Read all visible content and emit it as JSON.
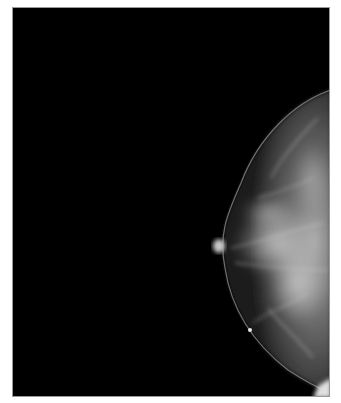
{
  "image": {
    "type": "mammogram",
    "view": "craniocaudal, right edge",
    "background_color": "#000000",
    "tissue_color": "#b8b8b8",
    "frame_border_color": "#9a9a9a",
    "page_background": "#ffffff"
  }
}
